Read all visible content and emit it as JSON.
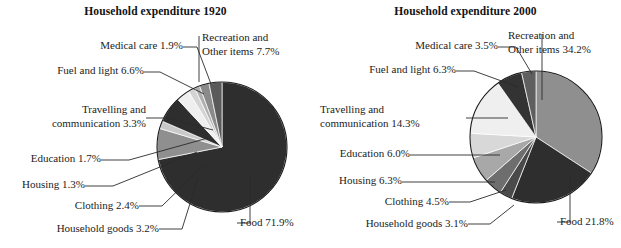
{
  "chart_data": [
    {
      "type": "pie",
      "title": "Household expenditure 1920",
      "xlabel": "",
      "ylabel": "",
      "legend_position": "callout-labels",
      "grid": false,
      "categories": [
        "Food",
        "Recreation and Other items",
        "Fuel and light",
        "Household goods",
        "Travelling and communication",
        "Clothing",
        "Medical care",
        "Education",
        "Housing"
      ],
      "values": [
        71.9,
        7.7,
        6.6,
        3.2,
        3.3,
        2.4,
        1.9,
        1.7,
        1.3
      ],
      "slices": [
        {
          "label": "Food",
          "value": 71.9,
          "value_text": "71.9%",
          "label_text": "Food 71.9%",
          "color": "#2e2e2e"
        },
        {
          "label": "Recreation and Other items",
          "value": 7.7,
          "value_text": "7.7%",
          "label_text": "Recreation and Other items 7.7%",
          "color": "#8f8f8f"
        },
        {
          "label": "Medical care",
          "value": 1.9,
          "value_text": "1.9%",
          "label_text": "Medical care 1.9%",
          "color": "#c9c9c9"
        },
        {
          "label": "Fuel and light",
          "value": 6.6,
          "value_text": "6.6%",
          "label_text": "Fuel and light 6.6%",
          "color": "#2e2e2e"
        },
        {
          "label": "Travelling and communication",
          "value": 3.3,
          "value_text": "3.3%",
          "label_text": "Travelling and communication 3.3%",
          "color": "#efefef"
        },
        {
          "label": "Education",
          "value": 1.7,
          "value_text": "1.7%",
          "label_text": "Education 1.7%",
          "color": "#d4d4d4"
        },
        {
          "label": "Housing",
          "value": 1.3,
          "value_text": "1.3%",
          "label_text": "Housing 1.3%",
          "color": "#b0b0b0"
        },
        {
          "label": "Clothing",
          "value": 2.4,
          "value_text": "2.4%",
          "label_text": "Clothing 2.4%",
          "color": "#8a8a8a"
        },
        {
          "label": "Household goods",
          "value": 3.2,
          "value_text": "3.2%",
          "label_text": "Household goods 3.2%",
          "color": "#5a5a5a"
        }
      ]
    },
    {
      "type": "pie",
      "title": "Household expenditure 2000",
      "xlabel": "",
      "ylabel": "",
      "legend_position": "callout-labels",
      "grid": false,
      "categories": [
        "Recreation and Other items",
        "Food",
        "Travelling and communication",
        "Fuel and light",
        "Housing",
        "Education",
        "Clothing",
        "Medical care",
        "Household goods"
      ],
      "values": [
        34.2,
        21.8,
        14.3,
        6.3,
        6.3,
        6.0,
        4.5,
        3.5,
        3.1
      ],
      "slices": [
        {
          "label": "Recreation and Other items",
          "value": 34.2,
          "value_text": "34.2%",
          "label_text": "Recreation and Other items 34.2%",
          "color": "#8f8f8f"
        },
        {
          "label": "Food",
          "value": 21.8,
          "value_text": "21.8%",
          "label_text": "Food 21.8%",
          "color": "#2e2e2e"
        },
        {
          "label": "Household goods",
          "value": 3.1,
          "value_text": "3.1%",
          "label_text": "Household goods 3.1%",
          "color": "#4a4a4a"
        },
        {
          "label": "Clothing",
          "value": 4.5,
          "value_text": "4.5%",
          "label_text": "Clothing 4.5%",
          "color": "#6e6e6e"
        },
        {
          "label": "Housing",
          "value": 6.3,
          "value_text": "6.3%",
          "label_text": "Housing 6.3%",
          "color": "#a8a8a8"
        },
        {
          "label": "Education",
          "value": 6.0,
          "value_text": "6.0%",
          "label_text": "Education 6.0%",
          "color": "#d8d8d8"
        },
        {
          "label": "Travelling and communication",
          "value": 14.3,
          "value_text": "14.3%",
          "label_text": "Travelling and communication 14.3%",
          "color": "#efefef"
        },
        {
          "label": "Fuel and light",
          "value": 6.3,
          "value_text": "6.3%",
          "label_text": "Fuel and light 6.3%",
          "color": "#333333"
        },
        {
          "label": "Medical care",
          "value": 3.5,
          "value_text": "3.5%",
          "label_text": "Medical care 3.5%",
          "color": "#5f5f5f"
        }
      ]
    }
  ],
  "chart_1920": {
    "title": "Household expenditure 1920",
    "labels": {
      "medical_care": "Medical care 1.9%",
      "recreation_line1": "Recreation and",
      "recreation_line2": "Other items 7.7%",
      "fuel_and_light": "Fuel and light 6.6%",
      "travelling_line1": "Travelling and",
      "travelling_line2": "communication 3.3%",
      "education": "Education 1.7%",
      "housing": "Housing 1.3%",
      "clothing": "Clothing 2.4%",
      "household_goods": "Household goods 3.2%",
      "food": "Food 71.9%"
    }
  },
  "chart_2000": {
    "title": "Household expenditure 2000",
    "labels": {
      "medical_care": "Medical care 3.5%",
      "recreation_line1": "Recreation and",
      "recreation_line2": "Other items 34.2%",
      "fuel_and_light": "Fuel and light 6.3%",
      "travelling_line1": "Travelling and",
      "travelling_line2": "communication 14.3%",
      "education": "Education 6.0%",
      "housing": "Housing 6.3%",
      "clothing": "Clothing 4.5%",
      "household_goods": "Household goods 3.1%",
      "food": "Food 21.8%"
    }
  }
}
